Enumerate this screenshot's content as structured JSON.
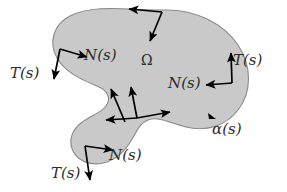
{
  "figure": {
    "background_color": "#ffffff",
    "region": {
      "name": "omega-region",
      "fill_color": "#c9c9c9",
      "stroke_color": "#8a8a8a",
      "label": "Ω",
      "label_x": 148,
      "label_y": 64
    },
    "curve": {
      "name": "boundary-curve",
      "label": "α(s)",
      "label_x": 214,
      "label_y": 134
    },
    "vector_color": "#000000",
    "labels": [
      {
        "id": "N-top-left",
        "text": "N(s)",
        "x": 84,
        "y": 60
      },
      {
        "id": "T-left",
        "text": "T(s)",
        "x": 10,
        "y": 78
      },
      {
        "id": "T-right",
        "text": "T(s)",
        "x": 233,
        "y": 65
      },
      {
        "id": "N-right",
        "text": "N(s)",
        "x": 168,
        "y": 88
      },
      {
        "id": "N-bottom",
        "text": "N(s)",
        "x": 109,
        "y": 160
      },
      {
        "id": "T-bottom",
        "text": "T(s)",
        "x": 51,
        "y": 178
      },
      {
        "id": "alpha-curve",
        "text": "α(s)",
        "x": 214,
        "y": 134
      },
      {
        "id": "omega-interior",
        "text": "Ω",
        "x": 146,
        "y": 64
      }
    ],
    "vectors": [
      {
        "id": "tangent-top",
        "kind": "T",
        "x1": 162,
        "y1": 12,
        "x2": 127,
        "y2": 9
      },
      {
        "id": "normal-top",
        "kind": "N",
        "x1": 162,
        "y1": 12,
        "x2": 150,
        "y2": 43
      },
      {
        "id": "normal-top-left",
        "kind": "N",
        "x1": 60,
        "y1": 49,
        "x2": 89,
        "y2": 57
      },
      {
        "id": "tangent-left",
        "kind": "T",
        "x1": 60,
        "y1": 49,
        "x2": 54,
        "y2": 81
      },
      {
        "id": "tangent-right",
        "kind": "T",
        "x1": 232,
        "y1": 83,
        "x2": 231,
        "y2": 51
      },
      {
        "id": "normal-right",
        "kind": "N",
        "x1": 232,
        "y1": 83,
        "x2": 204,
        "y2": 85
      },
      {
        "id": "normal-notch-upper",
        "kind": "N",
        "x1": 137,
        "y1": 118,
        "x2": 131,
        "y2": 85
      },
      {
        "id": "tangent-notch-left",
        "kind": "T",
        "x1": 137,
        "y1": 118,
        "x2": 104,
        "y2": 120
      },
      {
        "id": "normal-notch-right",
        "kind": "N",
        "x1": 137,
        "y1": 118,
        "x2": 172,
        "y2": 112
      },
      {
        "id": "vector-concave-edge",
        "kind": "T",
        "x1": 125,
        "y1": 122,
        "x2": 110,
        "y2": 87
      },
      {
        "id": "normal-bottom",
        "kind": "N",
        "x1": 85,
        "y1": 146,
        "x2": 115,
        "y2": 150
      },
      {
        "id": "tangent-bottom",
        "kind": "T",
        "x1": 85,
        "y1": 146,
        "x2": 90,
        "y2": 182
      }
    ],
    "curve_marker": {
      "id": "alpha-direction-marker",
      "x": 213,
      "y": 116
    }
  }
}
